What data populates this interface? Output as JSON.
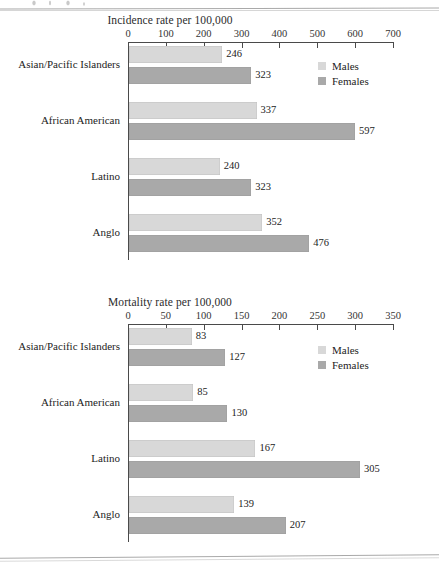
{
  "page": {
    "artifact_top_rule": "scan-line",
    "artifact_bottom_rule": "scan-line"
  },
  "charts": [
    {
      "id": "incidence",
      "title": "Incidence rate per 100,000",
      "axis": {
        "min": 0,
        "max": 700,
        "step": 100,
        "ticks": [
          "0",
          "100",
          "200",
          "300",
          "400",
          "500",
          "600",
          "700"
        ]
      },
      "legend": [
        {
          "label": "Males",
          "color": "#d8d8d8"
        },
        {
          "label": "Females",
          "color": "#a9a9a9"
        }
      ],
      "groups": [
        {
          "category": "Asian/Pacific Islanders",
          "males": 246,
          "females": 323
        },
        {
          "category": "African American",
          "males": 337,
          "females": 597
        },
        {
          "category": "Latino",
          "males": 240,
          "females": 323
        },
        {
          "category": "Anglo",
          "males": 352,
          "females": 476
        }
      ]
    },
    {
      "id": "mortality",
      "title": "Mortality rate per 100,000",
      "axis": {
        "min": 0,
        "max": 350,
        "step": 50,
        "ticks": [
          "0",
          "50",
          "100",
          "150",
          "200",
          "250",
          "300",
          "350"
        ]
      },
      "legend": [
        {
          "label": "Males",
          "color": "#d8d8d8"
        },
        {
          "label": "Females",
          "color": "#a9a9a9"
        }
      ],
      "groups": [
        {
          "category": "Asian/Pacific Islanders",
          "males": 83,
          "females": 127
        },
        {
          "category": "African American",
          "males": 85,
          "females": 130
        },
        {
          "category": "Latino",
          "males": 167,
          "females": 305
        },
        {
          "category": "Anglo",
          "males": 139,
          "females": 207
        }
      ]
    }
  ],
  "chart_data": [
    {
      "type": "bar",
      "orientation": "horizontal",
      "title": "Incidence rate per 100,000",
      "xlabel": "",
      "ylabel": "",
      "xlim": [
        0,
        700
      ],
      "xticks": [
        0,
        100,
        200,
        300,
        400,
        500,
        600,
        700
      ],
      "grid": false,
      "legend_position": "top-right",
      "categories": [
        "Asian/Pacific Islanders",
        "African American",
        "Latino",
        "Anglo"
      ],
      "series": [
        {
          "name": "Males",
          "color": "#d8d8d8",
          "values": [
            246,
            337,
            240,
            352
          ]
        },
        {
          "name": "Females",
          "color": "#a9a9a9",
          "values": [
            323,
            597,
            323,
            476
          ]
        }
      ]
    },
    {
      "type": "bar",
      "orientation": "horizontal",
      "title": "Mortality rate per 100,000",
      "xlabel": "",
      "ylabel": "",
      "xlim": [
        0,
        350
      ],
      "xticks": [
        0,
        50,
        100,
        150,
        200,
        250,
        300,
        350
      ],
      "grid": false,
      "legend_position": "top-right",
      "categories": [
        "Asian/Pacific Islanders",
        "African American",
        "Latino",
        "Anglo"
      ],
      "series": [
        {
          "name": "Males",
          "color": "#d8d8d8",
          "values": [
            83,
            85,
            167,
            139
          ]
        },
        {
          "name": "Females",
          "color": "#a9a9a9",
          "values": [
            127,
            130,
            305,
            207
          ]
        }
      ]
    }
  ]
}
